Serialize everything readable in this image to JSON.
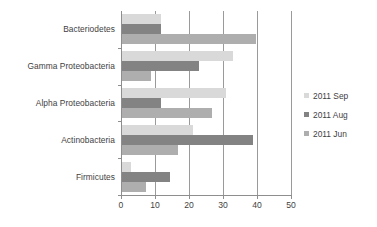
{
  "chart_data": {
    "type": "bar",
    "orientation": "horizontal",
    "title": "",
    "xlabel": "",
    "ylabel": "",
    "categories": [
      "Bacteriodetes",
      "Gamma Proteobacteria",
      "Alpha Proteobacteria",
      "Actinobacteria",
      "Firmicutes"
    ],
    "series": [
      {
        "name": "2011 Sep",
        "color": "#d9d9d9",
        "values": [
          11.5,
          32.5,
          30.5,
          21.0,
          2.5
        ]
      },
      {
        "name": "2011 Aug",
        "color": "#838383",
        "values": [
          11.5,
          22.5,
          11.5,
          38.5,
          14.0
        ]
      },
      {
        "name": "2011 Jun",
        "color": "#aeaeae",
        "values": [
          39.5,
          8.5,
          26.5,
          16.5,
          7.0
        ]
      }
    ],
    "xlim": [
      0,
      50
    ],
    "xticks": [
      0,
      10,
      20,
      30,
      40,
      50
    ],
    "xtick_labels": [
      "0",
      "10",
      "20",
      "30",
      "40",
      "50"
    ],
    "grid": "vertical",
    "legend_position": "right"
  },
  "legend": {
    "entries": [
      {
        "label": "2011 Sep",
        "color": "#d9d9d9"
      },
      {
        "label": "2011 Aug",
        "color": "#838383"
      },
      {
        "label": "2011 Jun",
        "color": "#aeaeae"
      }
    ]
  },
  "colors": {
    "background": "#ffffff",
    "gridline": "#9a9a9a",
    "axis": "#8e8e8e",
    "text": "#3f3f3f"
  }
}
